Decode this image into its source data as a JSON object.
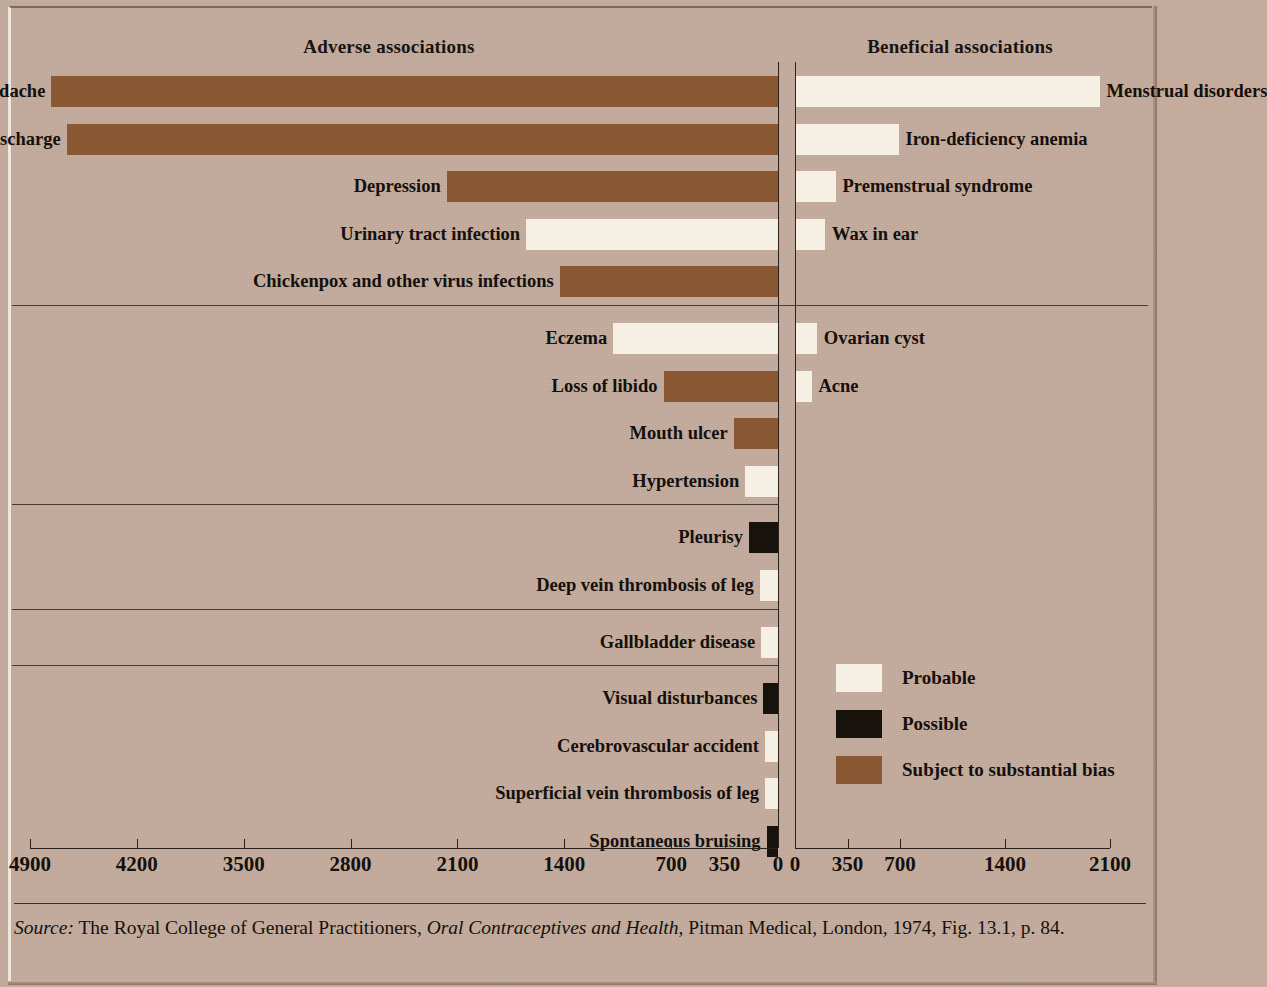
{
  "titles": {
    "adverse": "Adverse associations",
    "beneficial": "Beneficial associations"
  },
  "legend": {
    "items": [
      {
        "key": "probable",
        "label": "Probable",
        "color": "#f6efe3"
      },
      {
        "key": "possible",
        "label": "Possible",
        "color": "#18120d"
      },
      {
        "key": "bias",
        "label": "Subject to substantial bias",
        "color": "#8b5834"
      }
    ]
  },
  "source": {
    "prefix": "Source:",
    "text_before": " The Royal College of General Practitioners, ",
    "italic_work": "Oral Contraceptives and Health",
    "text_after": ", Pitman Medical, London, 1974, Fig. 13.1, p. 84."
  },
  "chart_data": {
    "type": "bar",
    "orientation": "horizontal",
    "panels": [
      {
        "name": "Adverse associations",
        "direction": "left",
        "axis_ticks": [
          4900,
          4200,
          3500,
          2800,
          2100,
          1400,
          700,
          350,
          0
        ],
        "axis_max": 4900,
        "groups": [
          {
            "items": [
              {
                "label": "Migraine and headache",
                "value": 4760,
                "category": "bias"
              },
              {
                "label": "Vaginal discharge",
                "value": 4660,
                "category": "bias"
              },
              {
                "label": "Depression",
                "value": 2170,
                "category": "bias"
              },
              {
                "label": "Urinary tract infection",
                "value": 1650,
                "category": "probable"
              },
              {
                "label": "Chickenpox and other virus infections",
                "value": 1430,
                "category": "bias"
              }
            ]
          },
          {
            "items": [
              {
                "label": "Eczema",
                "value": 1080,
                "category": "probable"
              },
              {
                "label": "Loss of libido",
                "value": 750,
                "category": "bias"
              },
              {
                "label": "Mouth ulcer",
                "value": 290,
                "category": "bias"
              },
              {
                "label": "Hypertension",
                "value": 215,
                "category": "probable"
              }
            ]
          },
          {
            "items": [
              {
                "label": "Pleurisy",
                "value": 190,
                "category": "possible"
              },
              {
                "label": "Deep vein thrombosis of leg",
                "value": 120,
                "category": "probable"
              }
            ]
          },
          {
            "items": [
              {
                "label": "Gallbladder disease",
                "value": 110,
                "category": "probable"
              }
            ]
          },
          {
            "items": [
              {
                "label": "Visual disturbances",
                "value": 95,
                "category": "possible"
              },
              {
                "label": "Cerebrovascular accident",
                "value": 85,
                "category": "probable"
              },
              {
                "label": "Superficial vein thrombosis of leg",
                "value": 85,
                "category": "probable"
              },
              {
                "label": "Spontaneous bruising",
                "value": 75,
                "category": "possible"
              }
            ]
          }
        ]
      },
      {
        "name": "Beneficial associations",
        "direction": "right",
        "axis_ticks": [
          0,
          350,
          700,
          1400,
          2100
        ],
        "axis_max": 2100,
        "groups": [
          {
            "items": [
              {
                "label": "Menstrual disorders",
                "value": 2030,
                "category": "probable"
              },
              {
                "label": "Iron-deficiency anemia",
                "value": 690,
                "category": "probable"
              },
              {
                "label": "Premenstrual syndrome",
                "value": 270,
                "category": "probable"
              },
              {
                "label": "Wax in ear",
                "value": 200,
                "category": "probable"
              }
            ]
          },
          {
            "items": [
              {
                "label": "Ovarian cyst",
                "value": 145,
                "category": "probable"
              },
              {
                "label": "Acne",
                "value": 110,
                "category": "probable"
              }
            ]
          }
        ]
      }
    ],
    "left_tick_labels": [
      "4900",
      "4200",
      "3500",
      "2800",
      "2100",
      "1400",
      "700",
      "350",
      "0"
    ],
    "right_tick_labels": [
      "0",
      "350",
      "700",
      "1400",
      "2100"
    ],
    "legend_entries": [
      "Probable",
      "Possible",
      "Subject to substantial bias"
    ],
    "xlabel": "",
    "ylabel": "",
    "grid": false
  }
}
